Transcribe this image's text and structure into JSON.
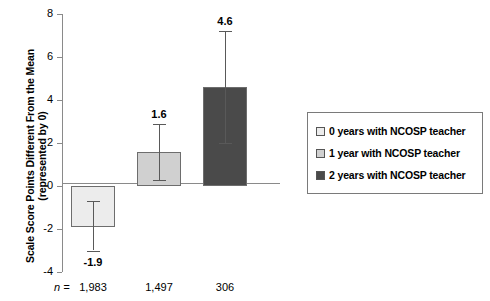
{
  "chart_data": {
    "type": "bar",
    "title": "",
    "xlabel": "",
    "ylabel_lines": [
      "Scale Score Points Different From the Mean",
      "(represented by 0)"
    ],
    "ylim": [
      -4,
      8
    ],
    "yticks": [
      8,
      6,
      4,
      2,
      0,
      -2,
      -4
    ],
    "ytick_labels": [
      "8",
      "6",
      "4",
      "2",
      "0",
      "-2",
      "-4"
    ],
    "grid": false,
    "legend_position": "right",
    "categories": [
      "0 years with NCOSP teacher",
      "1 year with NCOSP teacher",
      "2 years with NCOSP teacher"
    ],
    "values": [
      -1.9,
      1.6,
      4.6
    ],
    "value_labels": [
      "-1.9",
      "1.6",
      "4.6"
    ],
    "error_low": [
      -3.0,
      0.3,
      2.0
    ],
    "error_high": [
      -0.7,
      2.9,
      7.2
    ],
    "sample_sizes": [
      "1,983",
      "1,497",
      "306"
    ],
    "sample_size_prefix": "n =",
    "colors": {
      "bar_0_years": "#ececec",
      "bar_1_year": "#d0d0d0",
      "bar_2_years": "#4a4a4a",
      "bar_border": "#6d6d6d",
      "axis": "#8a8a8a",
      "error_bar": "#595959",
      "legend_border": "#7a7a7a",
      "background": "#ffffff"
    }
  },
  "legend": {
    "items": [
      {
        "label": "0 years with NCOSP teacher",
        "swatch": "#ececec"
      },
      {
        "label": "1 year with NCOSP teacher",
        "swatch": "#d0d0d0"
      },
      {
        "label": "2 years with NCOSP teacher",
        "swatch": "#4a4a4a"
      }
    ]
  }
}
